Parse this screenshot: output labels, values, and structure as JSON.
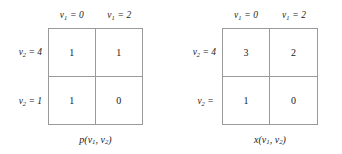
{
  "figure": {
    "type": "two-matrix-diagram",
    "background_color": "#ffffff",
    "grid_line_color": "#9a9a9a",
    "text_color": "#1a1a1a"
  },
  "matrices": [
    {
      "id": "p-matrix",
      "caption": "p(v1, v2)",
      "caption_function": "p",
      "caption_args": "v1, v2",
      "column_variable": "v1",
      "row_variable": "v2",
      "column_headers": [
        "v1 = 0",
        "v1 = 2"
      ],
      "column_values": [
        "0",
        "2"
      ],
      "row_labels": [
        "v2 = 4",
        "v2 = 1"
      ],
      "row_values": [
        "4",
        "1"
      ],
      "cells": [
        [
          "1",
          "1"
        ],
        [
          "1",
          "0"
        ]
      ]
    },
    {
      "id": "x-matrix",
      "caption": "x(v1, v2)",
      "caption_function": "x",
      "caption_args": "v1, v2",
      "column_variable": "v1",
      "row_variable": "v2",
      "column_headers": [
        "v1 = 0",
        "v1 = 2"
      ],
      "column_values": [
        "0",
        "2"
      ],
      "row_labels": [
        "v2 = 4",
        "v2 ="
      ],
      "row_values": [
        "4",
        ""
      ],
      "cells": [
        [
          "3",
          "2"
        ],
        [
          "1",
          "0"
        ]
      ]
    }
  ]
}
